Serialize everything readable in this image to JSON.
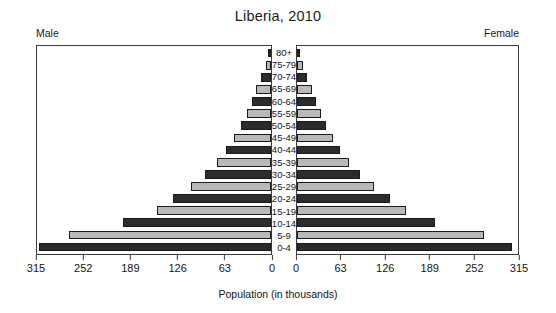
{
  "chart_data": {
    "type": "bar",
    "subtype": "population-pyramid",
    "title": "Liberia, 2010",
    "xlabel": "Population (in thousands)",
    "ylabel": "",
    "left_label": "Male",
    "right_label": "Female",
    "categories": [
      "80+",
      "75-79",
      "70-74",
      "65-69",
      "60-64",
      "55-59",
      "50-54",
      "45-49",
      "40-44",
      "35-39",
      "30-34",
      "25-29",
      "20-24",
      "15-19",
      "10-14",
      "5-9",
      "0-4"
    ],
    "series": [
      {
        "name": "Male",
        "side": "left",
        "values": [
          4,
          7,
          13,
          20,
          26,
          33,
          41,
          50,
          60,
          73,
          89,
          108,
          132,
          153,
          199,
          272,
          313
        ]
      },
      {
        "name": "Female",
        "side": "right",
        "values": [
          4,
          8,
          14,
          21,
          27,
          34,
          42,
          51,
          61,
          74,
          90,
          110,
          133,
          155,
          197,
          266,
          307
        ]
      }
    ],
    "xlim": [
      0,
      315
    ],
    "xticks_left": [
      315,
      252,
      189,
      126,
      63,
      0
    ],
    "xticks_right": [
      0,
      63,
      126,
      189,
      252,
      315
    ],
    "grid": false,
    "legend": "none",
    "bar_colors": {
      "dark": "#2b2b2b",
      "light": "#b9b9b9",
      "outline": "#1a1a1a"
    },
    "frame_color": "#3a3a3a",
    "background": "#ffffff"
  }
}
